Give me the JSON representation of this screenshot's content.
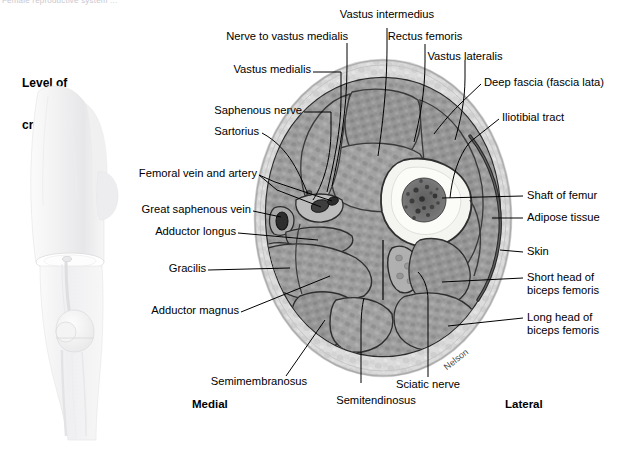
{
  "page": {
    "clipped_header": "Female reproductive system ...",
    "width": 620,
    "height": 450,
    "background": "#ffffff"
  },
  "inset": {
    "title_line1": "Level of",
    "title_line2": "cross section",
    "description": "lateral view of thigh and knee with cross-section plane"
  },
  "figure": {
    "signature": "Nelson",
    "orientation": {
      "medial": "Medial",
      "lateral": "Lateral"
    },
    "colors": {
      "muscle": "#9a9a9a",
      "muscle_dark": "#7e7e7e",
      "fat": "#dcdcdc",
      "skin": "#c9c9c9",
      "bone_cortex": "#f2f2ee",
      "marrow": "#6d6d6d",
      "outline": "#1a1a1a",
      "leader": "#000000"
    }
  },
  "labels": {
    "top": [
      {
        "id": "nerve-to-vastus-medialis",
        "text": "Nerve to vastus medialis"
      },
      {
        "id": "vastus-intermedius",
        "text": "Vastus intermedius"
      },
      {
        "id": "rectus-femoris",
        "text": "Rectus femoris"
      },
      {
        "id": "vastus-lateralis",
        "text": "Vastus lateralis"
      },
      {
        "id": "vastus-medialis",
        "text": "Vastus medialis"
      }
    ],
    "left": [
      {
        "id": "saphenous-nerve",
        "text": "Saphenous nerve"
      },
      {
        "id": "sartorius",
        "text": "Sartorius"
      },
      {
        "id": "femoral-vein-and-artery",
        "text": "Femoral vein and artery"
      },
      {
        "id": "great-saphenous-vein",
        "text": "Great saphenous vein"
      },
      {
        "id": "adductor-longus",
        "text": "Adductor longus"
      },
      {
        "id": "gracilis",
        "text": "Gracilis"
      },
      {
        "id": "adductor-magnus",
        "text": "Adductor magnus"
      },
      {
        "id": "semimembranosus",
        "text": "Semimembranosus"
      }
    ],
    "right": [
      {
        "id": "deep-fascia",
        "text": "Deep fascia (fascia lata)"
      },
      {
        "id": "iliotibial-tract",
        "text": "Iliotibial tract"
      },
      {
        "id": "shaft-of-femur",
        "text": "Shaft of femur"
      },
      {
        "id": "adipose-tissue",
        "text": "Adipose tissue"
      },
      {
        "id": "skin",
        "text": "Skin"
      },
      {
        "id": "short-head-biceps-femoris",
        "text": "Short head of\nbiceps femoris"
      },
      {
        "id": "long-head-biceps-femoris",
        "text": "Long head of\nbiceps femoris"
      }
    ],
    "bottom": [
      {
        "id": "sciatic-nerve",
        "text": "Sciatic nerve"
      },
      {
        "id": "semitendinosus",
        "text": "Semitendinosus"
      }
    ]
  }
}
